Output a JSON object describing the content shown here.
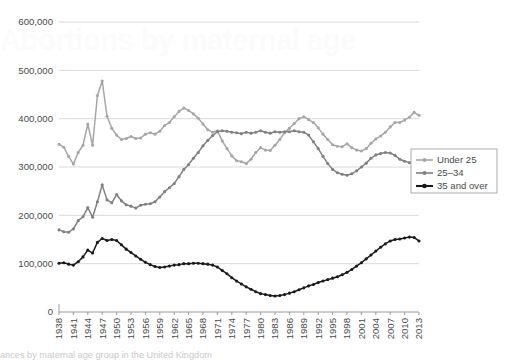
{
  "figure": {
    "ghost_title": "Abortions by maternal age",
    "caption": "ances by maternal age group in the United Kingdom"
  },
  "legend": {
    "position": "right-middle",
    "items": [
      {
        "label": "Under 25",
        "color": "#a6a6a6",
        "marker": "circle"
      },
      {
        "label": "25–34",
        "color": "#808080",
        "marker": "circle"
      },
      {
        "label": "35 and over",
        "color": "#1a1a1a",
        "marker": "circle"
      }
    ]
  },
  "chart_data": {
    "type": "line",
    "title": "",
    "subtitle": "",
    "xlabel": "",
    "ylabel": "",
    "grid": true,
    "legend_position": "right",
    "ylim": [
      0,
      600000
    ],
    "yticks": [
      0,
      100000,
      200000,
      300000,
      400000,
      500000,
      600000
    ],
    "ytick_labels": [
      "0",
      "100,000",
      "200,000",
      "300,000",
      "400,000",
      "500,000",
      "600,000"
    ],
    "xlim": [
      1938,
      2013
    ],
    "xtick_step": 3,
    "xticks": [
      1938,
      1941,
      1944,
      1947,
      1950,
      1953,
      1956,
      1959,
      1962,
      1965,
      1968,
      1971,
      1974,
      1977,
      1980,
      1983,
      1986,
      1989,
      1992,
      1995,
      1998,
      2001,
      2004,
      2007,
      2010,
      2013
    ],
    "xtick_labels": [
      "1938",
      "1941",
      "1944",
      "1947",
      "1950",
      "1953",
      "1956",
      "1959",
      "1962",
      "1965",
      "1968",
      "1971",
      "1974",
      "1977",
      "1980",
      "1983",
      "1986",
      "1989",
      "1992",
      "1995",
      "1998",
      "2001",
      "2004",
      "2007",
      "2010",
      "2013"
    ],
    "x": [
      1938,
      1939,
      1940,
      1941,
      1942,
      1943,
      1944,
      1945,
      1946,
      1947,
      1948,
      1949,
      1950,
      1951,
      1952,
      1953,
      1954,
      1955,
      1956,
      1957,
      1958,
      1959,
      1960,
      1961,
      1962,
      1963,
      1964,
      1965,
      1966,
      1967,
      1968,
      1969,
      1970,
      1971,
      1972,
      1973,
      1974,
      1975,
      1976,
      1977,
      1978,
      1979,
      1980,
      1981,
      1982,
      1983,
      1984,
      1985,
      1986,
      1987,
      1988,
      1989,
      1990,
      1991,
      1992,
      1993,
      1994,
      1995,
      1996,
      1997,
      1998,
      1999,
      2000,
      2001,
      2002,
      2003,
      2004,
      2005,
      2006,
      2007,
      2008,
      2009,
      2010,
      2011,
      2012,
      2013
    ],
    "series": [
      {
        "name": "Under 25",
        "color": "#a6a6a6",
        "values": [
          347000,
          341000,
          322000,
          306000,
          330000,
          345000,
          389000,
          345000,
          448000,
          478000,
          405000,
          380000,
          366000,
          357000,
          359000,
          363000,
          359000,
          360000,
          368000,
          371000,
          368000,
          374000,
          386000,
          392000,
          404000,
          415000,
          422000,
          417000,
          410000,
          401000,
          389000,
          377000,
          372000,
          375000,
          354000,
          338000,
          323000,
          313000,
          311000,
          307000,
          316000,
          330000,
          340000,
          335000,
          334000,
          345000,
          357000,
          371000,
          380000,
          390000,
          400000,
          404000,
          398000,
          392000,
          381000,
          368000,
          357000,
          346000,
          343000,
          342000,
          348000,
          340000,
          335000,
          333000,
          338000,
          349000,
          358000,
          364000,
          372000,
          383000,
          392000,
          392000,
          397000,
          403000,
          413000,
          407000
        ]
      },
      {
        "name": "25–34",
        "color": "#808080",
        "values": [
          170000,
          166000,
          165000,
          172000,
          189000,
          197000,
          216000,
          196000,
          228000,
          263000,
          232000,
          226000,
          243000,
          230000,
          222000,
          219000,
          215000,
          221000,
          223000,
          224000,
          228000,
          238000,
          249000,
          257000,
          266000,
          280000,
          295000,
          305000,
          318000,
          330000,
          344000,
          355000,
          365000,
          373000,
          375000,
          374000,
          372000,
          371000,
          369000,
          372000,
          370000,
          372000,
          375000,
          372000,
          370000,
          373000,
          372000,
          373000,
          373000,
          375000,
          373000,
          372000,
          366000,
          352000,
          338000,
          322000,
          307000,
          295000,
          288000,
          285000,
          283000,
          286000,
          292000,
          300000,
          308000,
          318000,
          325000,
          328000,
          330000,
          329000,
          324000,
          316000,
          312000,
          309000,
          306000,
          300000
        ]
      },
      {
        "name": "35 and over",
        "color": "#1a1a1a",
        "values": [
          101000,
          102000,
          99000,
          97000,
          104000,
          114000,
          128000,
          122000,
          144000,
          152000,
          148000,
          150000,
          148000,
          139000,
          130000,
          123000,
          116000,
          109000,
          103000,
          98000,
          94000,
          92000,
          93000,
          95000,
          97000,
          98000,
          100000,
          100000,
          101000,
          101000,
          100000,
          99000,
          97000,
          93000,
          86000,
          79000,
          71000,
          64000,
          58000,
          52000,
          47000,
          42000,
          38000,
          36000,
          34000,
          33000,
          34000,
          36000,
          39000,
          42000,
          46000,
          50000,
          54000,
          57000,
          61000,
          64000,
          67000,
          70000,
          73000,
          77000,
          82000,
          88000,
          95000,
          102000,
          110000,
          118000,
          126000,
          134000,
          141000,
          147000,
          150000,
          151000,
          153000,
          155000,
          154000,
          147000
        ]
      }
    ]
  }
}
